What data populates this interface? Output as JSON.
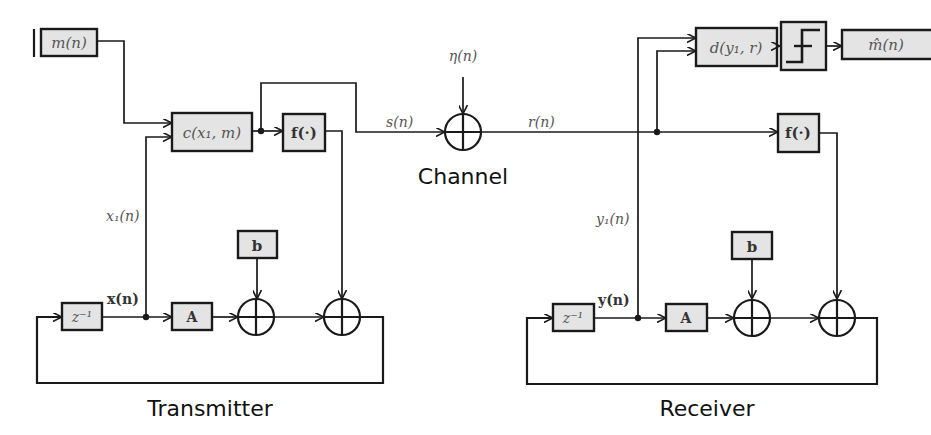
{
  "diagram": {
    "sections": {
      "transmitter": "Transmitter",
      "channel": "Channel",
      "receiver": "Receiver"
    },
    "transmitter": {
      "message_input": "m(n)",
      "encoder_block": "c(x₁, m)",
      "nonlinear_block": "f(·)",
      "delay_block": "z⁻¹",
      "matrix_block": "A",
      "bias_block": "b",
      "state_label": "x(n)",
      "component_label": "x₁(n)"
    },
    "channel": {
      "transmitted_signal": "s(n)",
      "noise_signal": "η(n)",
      "received_signal": "r(n)"
    },
    "receiver": {
      "decoder_block": "d(y₁, r)",
      "threshold_block": "step-function",
      "message_output": "m̂(n)",
      "nonlinear_block": "f(·)",
      "delay_block": "z⁻¹",
      "matrix_block": "A",
      "bias_block": "b",
      "state_label": "y(n)",
      "component_label": "y₁(n)"
    }
  }
}
